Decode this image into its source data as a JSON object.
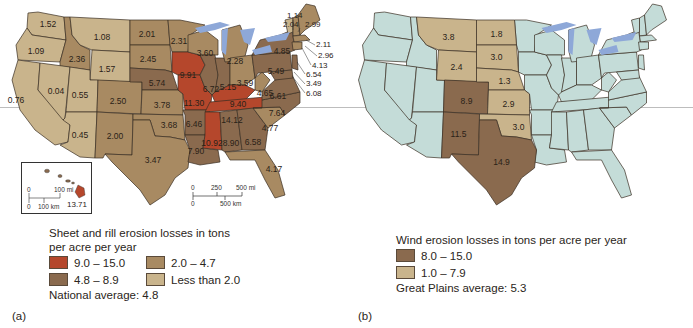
{
  "panel_a": {
    "label": "(a)",
    "legend": {
      "title_line1": "Sheet and rill erosion losses in tons",
      "title_line2": "per acre per year",
      "classes": [
        {
          "range": "9.0 – 15.0",
          "color": "#b5472c"
        },
        {
          "range": "2.0 – 4.7",
          "color": "#a88a62"
        },
        {
          "range": "4.8 – 8.9",
          "color": "#8a6a4e"
        },
        {
          "range": "Less than 2.0",
          "color": "#c9b48c"
        }
      ],
      "average": "National average: 4.8"
    },
    "inset": {
      "scale_mi_0": "0",
      "scale_mi": "100 mi",
      "scale_km_0": "0",
      "scale_km": "100 km",
      "hawaii_value": "13.71"
    },
    "scale_bar": {
      "zero_top": "0",
      "mid": "250",
      "mi": "500 mi",
      "zero_bottom": "0",
      "km": "500 km"
    },
    "state_values": {
      "WA": "1.52",
      "OR": "1.09",
      "CA": "0.76",
      "ID": "2.36",
      "NV": "0.04",
      "MT": "1.08",
      "WY": "1.57",
      "UT": "0.55",
      "AZ": "0.45",
      "CO": "2.50",
      "NM": "2.00",
      "ND": "2.01",
      "SD": "2.45",
      "NE": "5.74",
      "KS": "3.78",
      "OK": "3.68",
      "TX": "3.47",
      "MN": "2.31",
      "IA": "9.91",
      "MO": "11.30",
      "AR": "6.46",
      "LA": "7.90",
      "WI": "3.60",
      "IL": "6.72",
      "IN": "5.15",
      "MI": "2.28",
      "OH": "3.59",
      "KY": "9.40",
      "TN": "14.12",
      "MS": "10.92",
      "AL": "8.90",
      "GA": "6.58",
      "FL": "4.17",
      "SC": "4.77",
      "NC": "7.64",
      "VA": "6.61",
      "WV": "4.65",
      "PA": "5.49",
      "NY": "4.85",
      "VT": "1.14",
      "NH": "2.04",
      "ME": "2.99",
      "MA": "2.11",
      "RI": "2.96",
      "CT": "4.13",
      "NJ": "6.54",
      "DE": "3.49",
      "MD": "6.08"
    }
  },
  "panel_b": {
    "label": "(b)",
    "legend": {
      "title": "Wind erosion losses in tons per acre per year",
      "classes": [
        {
          "range": "8.0 – 15.0",
          "color": "#8a6a4e"
        },
        {
          "range": "1.0 – 7.9",
          "color": "#c9b48c"
        }
      ],
      "average": "Great Plains average: 5.3"
    },
    "state_values": {
      "MT": "3.8",
      "ND": "1.8",
      "SD": "3.0",
      "WY": "2.4",
      "NE": "1.3",
      "CO": "8.9",
      "KS": "2.9",
      "OK": "3.0",
      "NM": "11.5",
      "TX": "14.9"
    }
  },
  "colors": {
    "high": "#b5472c",
    "med_high": "#8a6a4e",
    "med": "#a88a62",
    "low": "#c9b48c",
    "no_data": "#c4dcd8",
    "water": "#8ea8d8"
  }
}
